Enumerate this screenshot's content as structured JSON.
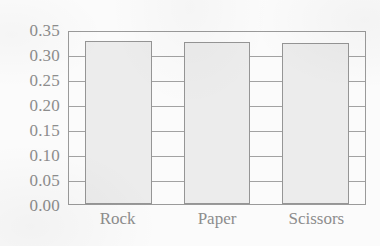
{
  "chart_data": {
    "type": "bar",
    "title": "",
    "subtitle": "",
    "xlabel": "",
    "ylabel": "",
    "categories": [
      "Rock",
      "Paper",
      "Scissors"
    ],
    "values": [
      0.332,
      0.33,
      0.328
    ],
    "series": [
      {
        "name": "",
        "values": [
          0.332,
          0.33,
          0.328
        ]
      }
    ],
    "ylim": [
      0.0,
      0.35
    ],
    "ytick_labels": [
      "0.35",
      "0.30",
      "0.25",
      "0.20",
      "0.15",
      "0.10",
      "0.05",
      "0.00"
    ],
    "ytick_values": [
      0.35,
      0.3,
      0.25,
      0.2,
      0.15,
      0.1,
      0.05,
      0.0
    ],
    "grid": true,
    "grid_axis": "y",
    "legend": false,
    "legend_position": "none",
    "annotations": [],
    "colors": {
      "bar_fill": "#ececec",
      "bar_border": "#959595",
      "gridline": "#a2a2a2",
      "frame": "#9a9a9a",
      "text": "#8d8d8d",
      "background": "#fbfbfb"
    }
  }
}
